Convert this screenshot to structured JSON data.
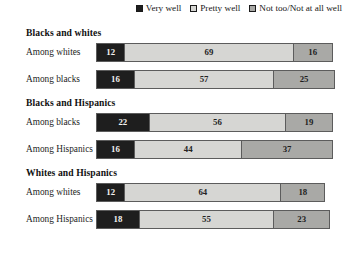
{
  "legend": {
    "entries": [
      {
        "label": "Very well",
        "key": "very",
        "color": "#1e1e1e"
      },
      {
        "label": "Pretty well",
        "key": "pretty",
        "color": "#d6d6d3"
      },
      {
        "label": "Not too/Not at all well",
        "key": "not",
        "color": "#a9a9a6"
      }
    ]
  },
  "groups": [
    {
      "title": "Blacks and whites",
      "rows": [
        {
          "label": "Among whites",
          "values": [
            12,
            69,
            16
          ]
        },
        {
          "label": "Among blacks",
          "values": [
            16,
            57,
            25
          ]
        }
      ]
    },
    {
      "title": "Blacks and Hispanics",
      "rows": [
        {
          "label": "Among blacks",
          "values": [
            22,
            56,
            19
          ]
        },
        {
          "label": "Among Hispanics",
          "values": [
            16,
            44,
            37
          ]
        }
      ]
    },
    {
      "title": "Whites and Hispanics",
      "rows": [
        {
          "label": "Among whites",
          "values": [
            12,
            64,
            18
          ]
        },
        {
          "label": "Among Hispanics",
          "values": [
            18,
            55,
            23
          ]
        }
      ]
    }
  ],
  "chart_data": {
    "type": "bar",
    "orientation": "horizontal",
    "stacked": true,
    "title": "",
    "subtitle": "",
    "xlabel": "",
    "ylabel": "",
    "xlim": [
      0,
      100
    ],
    "grid": false,
    "legend_position": "top-right",
    "legend_entries": [
      "Very well",
      "Pretty well",
      "Not too/Not at all well"
    ],
    "group_labels": [
      "Blacks and whites",
      "Blacks and Hispanics",
      "Whites and Hispanics"
    ],
    "categories": [
      "Blacks and whites / Among whites",
      "Blacks and whites / Among blacks",
      "Blacks and Hispanics / Among blacks",
      "Blacks and Hispanics / Among Hispanics",
      "Whites and Hispanics / Among whites",
      "Whites and Hispanics / Among Hispanics"
    ],
    "series": [
      {
        "name": "Very well",
        "color": "#1e1e1e",
        "values": [
          12,
          16,
          22,
          16,
          12,
          18
        ]
      },
      {
        "name": "Pretty well",
        "color": "#d6d6d3",
        "values": [
          69,
          57,
          56,
          44,
          64,
          55
        ]
      },
      {
        "name": "Not too/Not at all well",
        "color": "#a9a9a6",
        "values": [
          16,
          25,
          19,
          37,
          18,
          23
        ]
      }
    ],
    "data_labels": true,
    "row_totals": [
      97,
      98,
      97,
      97,
      94,
      96
    ]
  }
}
